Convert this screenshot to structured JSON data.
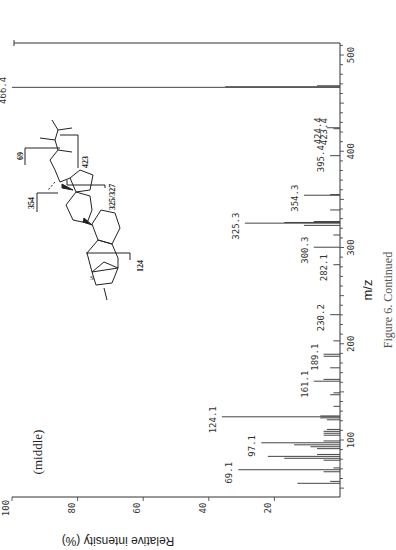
{
  "figure": {
    "panel_label": "(middle)",
    "caption_partial": "Figure 6. Continued",
    "orientation": "rotated 90 degrees counter-clockwise"
  },
  "structure": {
    "fragment_labels": [
      "69",
      "423",
      "354",
      "325/327",
      "124"
    ],
    "heteroatom": "S"
  },
  "chart_data": {
    "type": "bar",
    "title": "",
    "xlabel": "m/z",
    "ylabel": "Relative intensity (%)",
    "xlim": [
      40,
      512
    ],
    "ylim": [
      0,
      100
    ],
    "x_ticks": [
      100,
      200,
      300,
      400,
      500
    ],
    "y_ticks": [
      20,
      40,
      60,
      80,
      100
    ],
    "grid": false,
    "labeled_peaks": [
      {
        "mz": 69.1,
        "intensity": 31,
        "label": "69.1"
      },
      {
        "mz": 97.1,
        "intensity": 24,
        "label": "97.1"
      },
      {
        "mz": 124.1,
        "intensity": 36,
        "label": "124.1"
      },
      {
        "mz": 161.1,
        "intensity": 8,
        "label": "161.1"
      },
      {
        "mz": 189.1,
        "intensity": 5,
        "label": "189.1"
      },
      {
        "mz": 230.2,
        "intensity": 3,
        "label": "230.2"
      },
      {
        "mz": 282.1,
        "intensity": 2,
        "label": "282.1"
      },
      {
        "mz": 300.3,
        "intensity": 8,
        "label": "300.3"
      },
      {
        "mz": 325.3,
        "intensity": 29,
        "label": "325.3"
      },
      {
        "mz": 354.3,
        "intensity": 11,
        "label": "354.3"
      },
      {
        "mz": 395.4,
        "intensity": 3,
        "label": "395.4"
      },
      {
        "mz": 423.4,
        "intensity": 2,
        "label": "423.4"
      },
      {
        "mz": 424.4,
        "intensity": 4,
        "label": "424.4"
      },
      {
        "mz": 466.4,
        "intensity": 100,
        "label": "466.4"
      }
    ],
    "minor_peaks": [
      {
        "mz": 55,
        "intensity": 13
      },
      {
        "mz": 57,
        "intensity": 3
      },
      {
        "mz": 67,
        "intensity": 5
      },
      {
        "mz": 71,
        "intensity": 2
      },
      {
        "mz": 79,
        "intensity": 5
      },
      {
        "mz": 81,
        "intensity": 17
      },
      {
        "mz": 83,
        "intensity": 22
      },
      {
        "mz": 85,
        "intensity": 7
      },
      {
        "mz": 91,
        "intensity": 7
      },
      {
        "mz": 93,
        "intensity": 9
      },
      {
        "mz": 95,
        "intensity": 14
      },
      {
        "mz": 99,
        "intensity": 5
      },
      {
        "mz": 105,
        "intensity": 5
      },
      {
        "mz": 107,
        "intensity": 5
      },
      {
        "mz": 109,
        "intensity": 5
      },
      {
        "mz": 111,
        "intensity": 4
      },
      {
        "mz": 121,
        "intensity": 4
      },
      {
        "mz": 123,
        "intensity": 6
      },
      {
        "mz": 125,
        "intensity": 6
      },
      {
        "mz": 135,
        "intensity": 2
      },
      {
        "mz": 147,
        "intensity": 3
      },
      {
        "mz": 149,
        "intensity": 2
      },
      {
        "mz": 163,
        "intensity": 5
      },
      {
        "mz": 175,
        "intensity": 3
      },
      {
        "mz": 187,
        "intensity": 5
      },
      {
        "mz": 203,
        "intensity": 2
      },
      {
        "mz": 313,
        "intensity": 2
      },
      {
        "mz": 323,
        "intensity": 11
      },
      {
        "mz": 326,
        "intensity": 17
      },
      {
        "mz": 327,
        "intensity": 8
      },
      {
        "mz": 339,
        "intensity": 3
      },
      {
        "mz": 355,
        "intensity": 3
      },
      {
        "mz": 467,
        "intensity": 35
      },
      {
        "mz": 468,
        "intensity": 7
      }
    ]
  }
}
